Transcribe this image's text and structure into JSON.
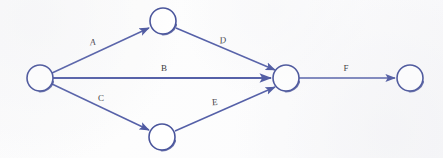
{
  "diagram": {
    "type": "activity-network-diagram",
    "background_color": "#fdfdfd",
    "line_color": "#5560a8",
    "node_fill_color": "#ffffff",
    "node_stroke_color": "#4a559c",
    "label_color": "#3b3b3f",
    "node_radius": 13,
    "nodes": [
      {
        "id": "n1",
        "name": "start-node",
        "cx": 40,
        "cy": 78,
        "r": 13,
        "label": ""
      },
      {
        "id": "n2",
        "name": "upper-node",
        "cx": 163,
        "cy": 21,
        "r": 13,
        "label": ""
      },
      {
        "id": "n3",
        "name": "lower-node",
        "cx": 162,
        "cy": 137,
        "r": 13,
        "label": ""
      },
      {
        "id": "n4",
        "name": "merge-node",
        "cx": 286,
        "cy": 78,
        "r": 13,
        "label": ""
      },
      {
        "id": "n5",
        "name": "end-node",
        "cx": 410,
        "cy": 78,
        "r": 13,
        "label": ""
      }
    ],
    "edges": [
      {
        "id": "e1",
        "name": "edge-a",
        "label": "A",
        "from": "n1",
        "to": "n2",
        "label_x": 93,
        "label_y": 43,
        "italic": true
      },
      {
        "id": "e2",
        "name": "edge-b",
        "label": "B",
        "from": "n1",
        "to": "n4",
        "label_x": 164,
        "label_y": 69,
        "italic": false
      },
      {
        "id": "e3",
        "name": "edge-c",
        "label": "C",
        "from": "n1",
        "to": "n3",
        "label_x": 101,
        "label_y": 99,
        "italic": false
      },
      {
        "id": "e4",
        "name": "edge-d",
        "label": "D",
        "from": "n2",
        "to": "n4",
        "label_x": 223,
        "label_y": 41,
        "italic": true
      },
      {
        "id": "e5",
        "name": "edge-e",
        "label": "E",
        "from": "n3",
        "to": "n4",
        "label_x": 215,
        "label_y": 103,
        "italic": false
      },
      {
        "id": "e6",
        "name": "edge-f",
        "label": "F",
        "from": "n4",
        "to": "n5",
        "label_x": 346,
        "label_y": 69,
        "italic": false
      }
    ]
  }
}
